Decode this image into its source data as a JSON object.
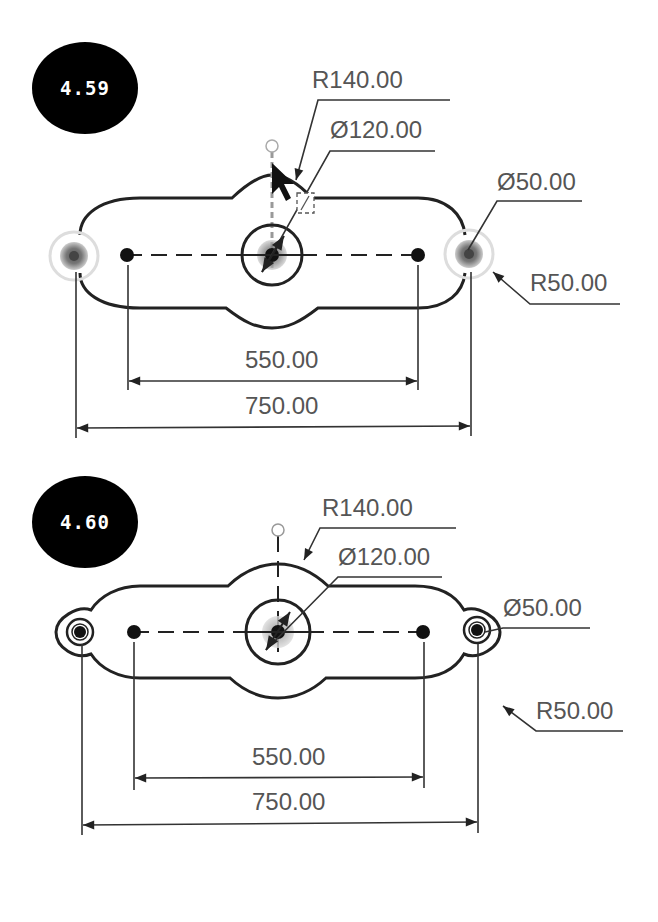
{
  "figures": [
    {
      "label": "4.59",
      "dimensions": {
        "radius_large": "R140.00",
        "diameter_center": "Ø120.00",
        "diameter_small": "Ø50.00",
        "radius_small": "R50.00",
        "inner_span": "550.00",
        "outer_span": "750.00"
      },
      "state": "selecting-center-hole",
      "cursor_icon": "arrow-pointer-with-diameter-badge"
    },
    {
      "label": "4.60",
      "dimensions": {
        "radius_large": "R140.00",
        "diameter_center": "Ø120.00",
        "diameter_small": "Ø50.00",
        "radius_small": "R50.00",
        "inner_span": "550.00",
        "outer_span": "750.00"
      },
      "state": "completed"
    }
  ]
}
